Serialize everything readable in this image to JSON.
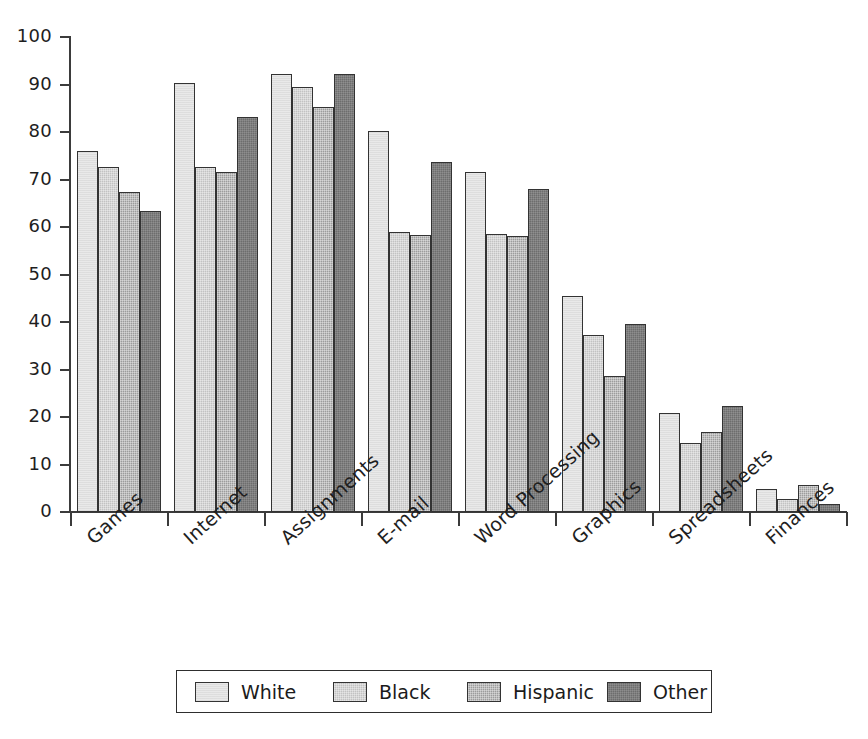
{
  "chart_data": {
    "type": "bar",
    "title": "",
    "subtitle": "",
    "xlabel": "",
    "ylabel": "",
    "ylim": [
      0,
      100
    ],
    "ytick_labels": [
      "100",
      "90",
      "80",
      "70",
      "60",
      "50",
      "40",
      "30",
      "20",
      "10",
      "0"
    ],
    "ytick_values": [
      100,
      90,
      80,
      70,
      60,
      50,
      40,
      30,
      20,
      10,
      0
    ],
    "grid": false,
    "legend_position": "bottom",
    "categories": [
      "Games",
      "Internet",
      "Assignments",
      "E-mail",
      "Word Processing",
      "Graphics",
      "Spreadsheets",
      "Finances"
    ],
    "series": [
      {
        "name": "White",
        "color": "#e9e9e9",
        "values": [
          76.1,
          90.3,
          92.3,
          80.3,
          71.6,
          45.4,
          20.8,
          4.9
        ]
      },
      {
        "name": "Black",
        "color": "#c2c2c2",
        "values": [
          72.7,
          72.6,
          89.4,
          58.9,
          58.6,
          37.2,
          14.6,
          2.7
        ]
      },
      {
        "name": "Hispanic",
        "color": "#9c9c9c",
        "values": [
          67.3,
          71.5,
          85.3,
          58.4,
          58.2,
          28.6,
          16.8,
          5.6
        ]
      },
      {
        "name": "Other",
        "color": "#6d6d6d",
        "values": [
          63.3,
          83.1,
          92.3,
          73.7,
          67.9,
          39.5,
          22.3,
          1.7
        ]
      }
    ]
  },
  "legend": {
    "entries": [
      "White",
      "Black",
      "Hispanic",
      "Other"
    ]
  }
}
